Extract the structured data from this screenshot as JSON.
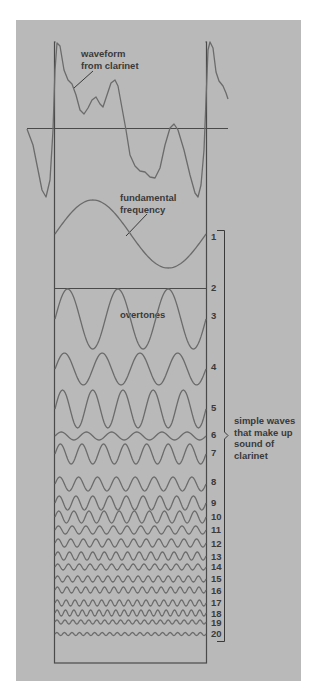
{
  "diagram": {
    "colors": {
      "page_background": "#ffffff",
      "panel_background": "#b9b9b9",
      "box_line": "#4a4a4a",
      "wave_line": "#6b6b6b",
      "text": "#3a3a3a"
    },
    "labels": {
      "waveform_line1": "waveform",
      "waveform_line2": "from clarinet",
      "fundamental_line1": "fundamental",
      "fundamental_line2": "frequency",
      "overtones": "overtones",
      "bracket_line1": "simple waves",
      "bracket_line2": "that make up",
      "bracket_line3": "sound of",
      "bracket_line4": "clarinet"
    },
    "harmonics": [
      {
        "n": "1",
        "label_y": 240,
        "center_y": 234,
        "amp": 34,
        "periods": 1
      },
      {
        "n": "2",
        "label_y": 291,
        "center_y": 288,
        "amp": 0,
        "periods": 2
      },
      {
        "n": "3",
        "label_y": 319,
        "center_y": 319,
        "amp": 30,
        "periods": 3
      },
      {
        "n": "4",
        "label_y": 370,
        "center_y": 369,
        "amp": 16,
        "periods": 4
      },
      {
        "n": "5",
        "label_y": 411,
        "center_y": 409,
        "amp": 19,
        "periods": 5
      },
      {
        "n": "6",
        "label_y": 438,
        "center_y": 436,
        "amp": 4,
        "periods": 6
      },
      {
        "n": "7",
        "label_y": 456,
        "center_y": 454,
        "amp": 10,
        "periods": 7
      },
      {
        "n": "8",
        "label_y": 485,
        "center_y": 484,
        "amp": 7,
        "periods": 8
      },
      {
        "n": "9",
        "label_y": 506,
        "center_y": 503,
        "amp": 7,
        "periods": 9
      },
      {
        "n": "10",
        "label_y": 520,
        "center_y": 517,
        "amp": 6,
        "periods": 10
      },
      {
        "n": "11",
        "label_y": 533,
        "center_y": 530,
        "amp": 4,
        "periods": 11
      },
      {
        "n": "12",
        "label_y": 547,
        "center_y": 543,
        "amp": 4,
        "periods": 12
      },
      {
        "n": "13",
        "label_y": 560,
        "center_y": 556,
        "amp": 4,
        "periods": 13
      },
      {
        "n": "14",
        "label_y": 570,
        "center_y": 567,
        "amp": 3,
        "periods": 14
      },
      {
        "n": "15",
        "label_y": 582,
        "center_y": 579,
        "amp": 3,
        "periods": 15
      },
      {
        "n": "16",
        "label_y": 594,
        "center_y": 590,
        "amp": 3,
        "periods": 16
      },
      {
        "n": "17",
        "label_y": 606,
        "center_y": 603,
        "amp": 3,
        "periods": 17
      },
      {
        "n": "18",
        "label_y": 617,
        "center_y": 613,
        "amp": 3,
        "periods": 18
      },
      {
        "n": "19",
        "label_y": 626,
        "center_y": 622,
        "amp": 2,
        "periods": 19
      },
      {
        "n": "20",
        "label_y": 637,
        "center_y": 634,
        "amp": 1.5,
        "periods": 20
      }
    ],
    "waveform_points": [
      [
        27,
        129
      ],
      [
        33,
        145
      ],
      [
        38,
        170
      ],
      [
        42,
        190
      ],
      [
        46,
        197
      ],
      [
        50,
        180
      ],
      [
        53,
        130
      ],
      [
        55,
        70
      ],
      [
        57,
        43
      ],
      [
        60,
        46
      ],
      [
        64,
        70
      ],
      [
        68,
        80
      ],
      [
        72,
        84
      ],
      [
        76,
        95
      ],
      [
        80,
        110
      ],
      [
        84,
        114
      ],
      [
        88,
        108
      ],
      [
        92,
        100
      ],
      [
        96,
        97
      ],
      [
        100,
        104
      ],
      [
        103,
        107
      ],
      [
        107,
        95
      ],
      [
        111,
        83
      ],
      [
        115,
        80
      ],
      [
        118,
        86
      ],
      [
        122,
        108
      ],
      [
        126,
        130
      ],
      [
        130,
        155
      ],
      [
        135,
        166
      ],
      [
        140,
        171
      ],
      [
        145,
        172
      ],
      [
        150,
        177
      ],
      [
        155,
        178
      ],
      [
        160,
        168
      ],
      [
        165,
        145
      ],
      [
        170,
        128
      ],
      [
        174,
        124
      ],
      [
        178,
        130
      ],
      [
        184,
        150
      ],
      [
        190,
        175
      ],
      [
        195,
        193
      ],
      [
        198,
        197
      ],
      [
        201,
        185
      ],
      [
        204,
        150
      ],
      [
        206,
        100
      ],
      [
        208,
        50
      ],
      [
        210,
        42
      ],
      [
        213,
        48
      ],
      [
        216,
        72
      ],
      [
        219,
        81
      ],
      [
        223,
        86
      ],
      [
        226,
        93
      ],
      [
        228,
        99
      ]
    ]
  }
}
